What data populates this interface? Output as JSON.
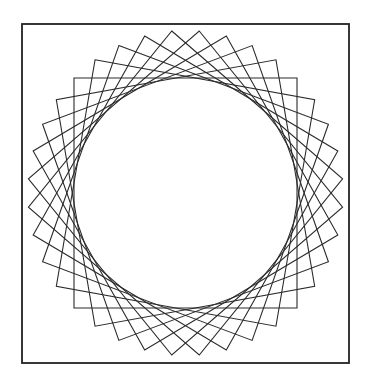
{
  "figure": {
    "frame": {
      "x": 22,
      "y": 24,
      "width": 327,
      "height": 339,
      "stroke": "#222222"
    },
    "pattern": {
      "center": [
        185.5,
        193
      ],
      "half_side_x": 111.5,
      "half_side_y": 115,
      "square_count": 9,
      "rotation_step_deg": 10,
      "rotations_deg": [
        0,
        10,
        20,
        30,
        40,
        50,
        60,
        70,
        80
      ],
      "stroke": "#2a2a2a"
    }
  }
}
